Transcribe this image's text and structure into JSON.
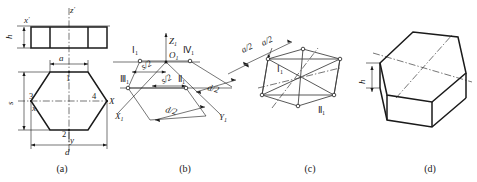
{
  "figure": {
    "captions": [
      {
        "id": "a",
        "text": "(a)",
        "x": 62,
        "y": 172
      },
      {
        "id": "b",
        "text": "(b)",
        "x": 185,
        "y": 172
      },
      {
        "id": "c",
        "text": "(c)",
        "x": 310,
        "y": 172
      },
      {
        "id": "d",
        "text": "(d)",
        "x": 430,
        "y": 172
      }
    ],
    "accent_color": "#1a1a1a",
    "line_color": "#3a3a3a",
    "background": "#ffffff"
  },
  "view_a": {
    "name": "orthographic-views",
    "description": "Front view rectangle above, top view regular hexagon below",
    "axis_labels": [
      {
        "key": "z_prime",
        "text": "z",
        "prime": "′",
        "x": 73,
        "y": 12
      },
      {
        "key": "x_prime",
        "text": "x",
        "prime": "′",
        "x": 27,
        "y": 22
      },
      {
        "key": "x_axis",
        "text": "x",
        "x": 36,
        "y": 108
      },
      {
        "key": "y_axis",
        "text": "y",
        "x": 64,
        "y": 143
      },
      {
        "key": "X_axis",
        "text": "X",
        "x": 110,
        "y": 103
      }
    ],
    "dimensions": [
      {
        "key": "h",
        "text": "h",
        "x": 14,
        "y": 36
      },
      {
        "key": "a",
        "text": "a",
        "x": 62,
        "y": 60
      },
      {
        "key": "s",
        "text": "s",
        "x": 15,
        "y": 103
      },
      {
        "key": "d",
        "text": "d",
        "x": 62,
        "y": 152
      }
    ],
    "vertex_labels": [
      {
        "text": "1",
        "x": 65,
        "y": 78
      },
      {
        "text": "2",
        "x": 63,
        "y": 135
      },
      {
        "text": "3",
        "x": 33,
        "y": 99
      },
      {
        "text": "4",
        "x": 94,
        "y": 99
      }
    ]
  },
  "view_b": {
    "name": "isometric-axes-setout",
    "description": "Isometric axes with half-dimension offsets marking four points",
    "axis_labels": [
      {
        "key": "Z1",
        "text": "Z",
        "sub": "1",
        "x": 168,
        "y": 45
      },
      {
        "key": "O1",
        "text": "O",
        "sub": "1",
        "x": 170,
        "y": 58
      },
      {
        "key": "X1",
        "text": "X",
        "sub": "1",
        "x": 119,
        "y": 120
      },
      {
        "key": "Y1",
        "text": "Y",
        "sub": "1",
        "x": 222,
        "y": 122
      }
    ],
    "point_labels": [
      {
        "key": "I1",
        "text": "Ⅰ",
        "sub": "1",
        "x": 136,
        "y": 50
      },
      {
        "key": "IV1",
        "text": "Ⅳ",
        "sub": "1",
        "x": 188,
        "y": 50
      },
      {
        "key": "III1",
        "text": "Ⅲ",
        "sub": "1",
        "x": 126,
        "y": 96
      },
      {
        "key": "II1",
        "text": "Ⅱ",
        "sub": "1",
        "x": 182,
        "y": 96
      }
    ],
    "dimensions": [
      {
        "key": "s_over_2_left",
        "text": "s/2",
        "x": 141,
        "y": 76,
        "rotate": -28
      },
      {
        "key": "s_over_2_right",
        "text": "s/2",
        "x": 163,
        "y": 88,
        "rotate": -28
      },
      {
        "key": "d_over_2_left",
        "text": "d/2",
        "x": 167,
        "y": 110,
        "rotate": 28
      },
      {
        "key": "d_over_2_right",
        "text": "d/2",
        "x": 209,
        "y": 92,
        "rotate": 28
      }
    ]
  },
  "view_c": {
    "name": "isometric-hexagon-construction",
    "description": "Isometric hexagon outline completed from the four set-out points",
    "dimensions": [
      {
        "key": "a_over_2_first",
        "text": "a/2",
        "x": 248,
        "y": 47,
        "rotate": -30
      },
      {
        "key": "a_over_2_second",
        "text": "a/2",
        "x": 266,
        "y": 42,
        "rotate": -30
      }
    ],
    "point_labels": [
      {
        "key": "I1",
        "text": "Ⅰ",
        "sub": "1",
        "x": 281,
        "y": 73
      },
      {
        "key": "II1",
        "text": "Ⅱ",
        "sub": "1",
        "x": 322,
        "y": 113
      }
    ]
  },
  "view_d": {
    "name": "isometric-prism-result",
    "description": "Completed isometric projection of the hexagonal prism",
    "dimensions": [
      {
        "key": "h",
        "text": "h",
        "x": 368,
        "y": 82
      }
    ]
  }
}
